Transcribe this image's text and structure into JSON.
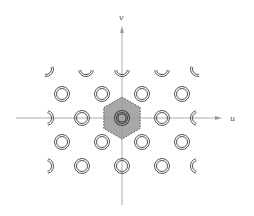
{
  "diagram": {
    "type": "reciprocal-lattice",
    "axes": {
      "x_label": "u",
      "y_label": "v"
    },
    "colors": {
      "axis": "#9a9a9a",
      "ring": "#444444",
      "cell_fill": "#a8a8a8",
      "cell_stroke": "#333333"
    },
    "origin": [
      122,
      118
    ],
    "cell": {
      "shape": "hexagon",
      "style": "dashed",
      "label": ""
    },
    "lattice_points": [
      {
        "x": 46,
        "y": 69,
        "clip": "bottom-right"
      },
      {
        "x": 86,
        "y": 69,
        "clip": "bottom"
      },
      {
        "x": 122,
        "y": 69,
        "clip": "bottom"
      },
      {
        "x": 162,
        "y": 69,
        "clip": "bottom"
      },
      {
        "x": 198,
        "y": 69,
        "clip": "bottom-left"
      },
      {
        "x": 62,
        "y": 94,
        "clip": "none"
      },
      {
        "x": 102,
        "y": 94,
        "clip": "none"
      },
      {
        "x": 142,
        "y": 94,
        "clip": "none"
      },
      {
        "x": 182,
        "y": 94,
        "clip": "none"
      },
      {
        "x": 46,
        "y": 118,
        "clip": "right"
      },
      {
        "x": 82,
        "y": 118,
        "clip": "none"
      },
      {
        "x": 122,
        "y": 118,
        "clip": "none",
        "center": true
      },
      {
        "x": 162,
        "y": 118,
        "clip": "none"
      },
      {
        "x": 198,
        "y": 118,
        "clip": "left"
      },
      {
        "x": 62,
        "y": 142,
        "clip": "none"
      },
      {
        "x": 102,
        "y": 142,
        "clip": "none"
      },
      {
        "x": 142,
        "y": 142,
        "clip": "none"
      },
      {
        "x": 182,
        "y": 142,
        "clip": "none"
      },
      {
        "x": 46,
        "y": 166,
        "clip": "right"
      },
      {
        "x": 82,
        "y": 166,
        "clip": "none"
      },
      {
        "x": 122,
        "y": 166,
        "clip": "none"
      },
      {
        "x": 162,
        "y": 166,
        "clip": "none"
      },
      {
        "x": 198,
        "y": 166,
        "clip": "left"
      }
    ]
  }
}
